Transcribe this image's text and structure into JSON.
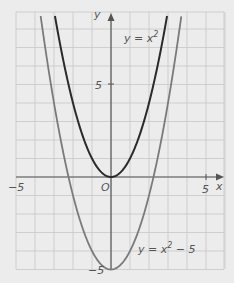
{
  "chart_data": {
    "type": "line",
    "title": "",
    "xlabel": "x",
    "ylabel": "y",
    "xlim": [
      -5,
      6
    ],
    "ylim": [
      -5,
      8.8
    ],
    "grid": true,
    "x_ticks": [
      {
        "value": -5,
        "label": "-5"
      },
      {
        "value": 0,
        "label": "O"
      },
      {
        "value": 5,
        "label": "5"
      }
    ],
    "y_ticks": [
      {
        "value": 5,
        "label": "5"
      },
      {
        "value": -5,
        "label": "-5"
      }
    ],
    "series": [
      {
        "name": "y = x²",
        "equation": "y = x^2",
        "color": "#2a2a2a",
        "x": [
          -3,
          -2,
          -1,
          0,
          1,
          2,
          3
        ],
        "values": [
          9,
          4,
          1,
          0,
          1,
          4,
          9
        ]
      },
      {
        "name": "y = x² − 5",
        "equation": "y = x^2 - 5",
        "color": "#7a7a7a",
        "x": [
          -3.7,
          -3,
          -2,
          -1,
          0,
          1,
          2,
          3,
          3.7
        ],
        "values": [
          8.7,
          4,
          -1,
          -4,
          -5,
          -4,
          -1,
          4,
          8.7
        ]
      }
    ],
    "annotations": [
      {
        "text": "y = x",
        "sup": "2",
        "near": "y = x² curve, upper right"
      },
      {
        "text": "y = x",
        "sup": "2",
        "suffix": " − 5",
        "near": "lower right"
      }
    ]
  },
  "labels": {
    "x_axis": "x",
    "y_axis": "y",
    "origin": "O",
    "x_neg5": "−5",
    "x_pos5": "5",
    "y_pos5": "5",
    "y_neg5": "−5",
    "curve1_base": "y = x",
    "curve1_sup": "2",
    "curve2_base": "y = x",
    "curve2_sup": "2",
    "curve2_suffix": " − 5"
  },
  "colors": {
    "background": "#ececec",
    "grid": "#c8c8c8",
    "axis": "#555555",
    "curve1": "#2a2a2a",
    "curve2": "#7a7a7a"
  }
}
